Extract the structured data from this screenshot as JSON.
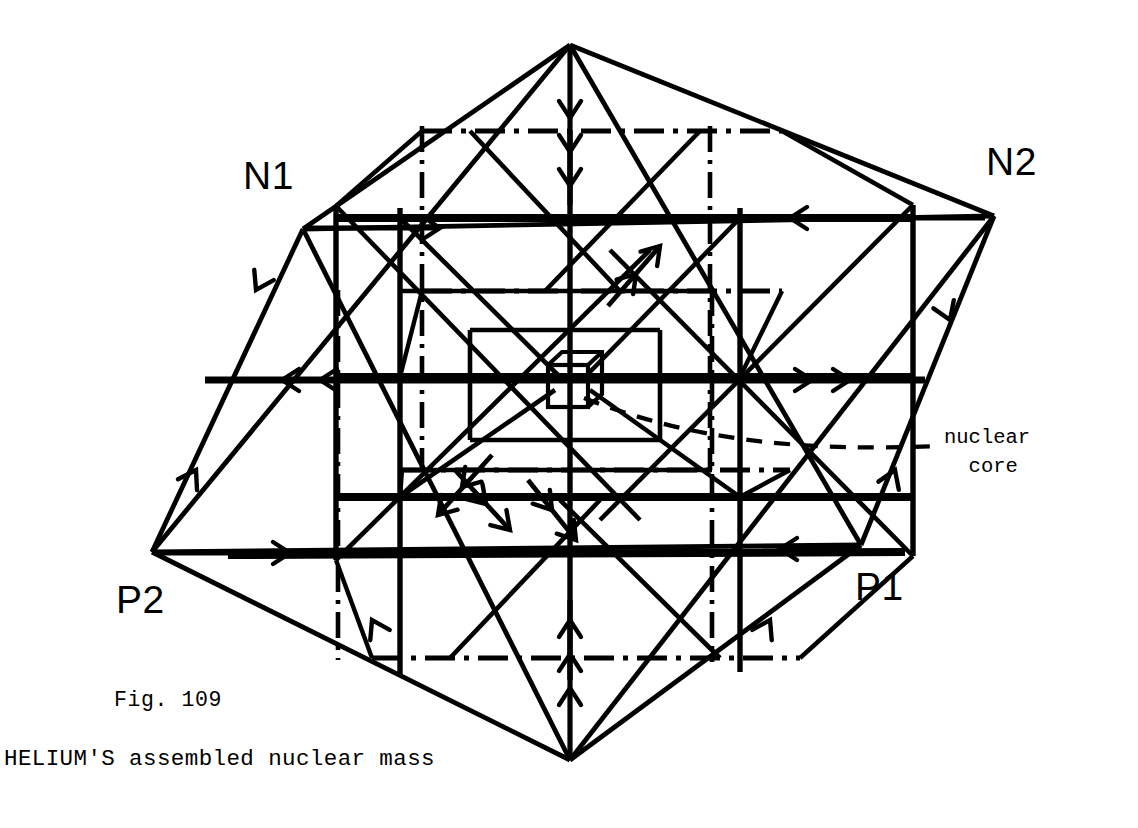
{
  "figure": {
    "number_label": "Fig. 109",
    "title": "HELIUM'S assembled nuclear mass",
    "background_color": "#ffffff",
    "ink_color": "#000000",
    "canvas": {
      "width": 1138,
      "height": 828
    }
  },
  "vertex_labels": {
    "n1": "N1",
    "n2": "N2",
    "p1": "P1",
    "p2": "P2"
  },
  "annotations": {
    "nuclear_core": "nuclear\n  core"
  },
  "diagram_data": {
    "type": "wireframe-3d-schematic",
    "subject": "helium nucleus assembled mass: octahedron of 2 protons and 2 neutrons enclosing nested cubic lattice with a nuclear core cube at center",
    "octahedron_vertices": {
      "top_apex": {
        "x": 570,
        "y": 45
      },
      "bottom_apex": {
        "x": 570,
        "y": 760
      },
      "n1": {
        "x": 303,
        "y": 229
      },
      "n2": {
        "x": 994,
        "y": 216
      },
      "p2": {
        "x": 152,
        "y": 552
      },
      "p1": {
        "x": 861,
        "y": 545
      }
    },
    "nuclear_core_cube": {
      "center": {
        "x": 567,
        "y": 385
      },
      "size": 42,
      "depth_offset": 14,
      "style": "solid outline small cube"
    },
    "line_styles": {
      "octahedron_edge": {
        "stroke_width": 4.6,
        "dash": "none"
      },
      "outer_cube_visible": {
        "stroke_width": 8.0,
        "dash": "none"
      },
      "outer_cube_hidden": {
        "stroke_width": 4.6,
        "dash": "28 9 4 9"
      },
      "inner_cube": {
        "stroke_width": 4.4,
        "dash": "none"
      },
      "inner_cube_hidden": {
        "stroke_width": 4.2,
        "dash": "24 8 3 8"
      },
      "leader_line": {
        "stroke_width": 4.0,
        "dash": "15 11"
      },
      "flow_arrow": {
        "stroke_width": 4.4,
        "dash": "none"
      }
    },
    "flow_arrows": [
      {
        "id": "n1-rail-right",
        "direction": "right",
        "heads": 1,
        "note": "horizontal rail leaving N1 toward interior"
      },
      {
        "id": "n2-rail-left",
        "direction": "left",
        "heads": 1,
        "note": "horizontal rail leaving N2 toward interior"
      },
      {
        "id": "p2-rail-right",
        "direction": "right",
        "heads": 1,
        "note": "horizontal rail leaving P2 toward interior"
      },
      {
        "id": "p1-rail-left",
        "direction": "left",
        "heads": 1,
        "note": "horizontal rail leaving P1 toward interior"
      },
      {
        "id": "mid-left-rail-left",
        "direction": "left",
        "heads": 2,
        "note": "mid-height left rail, double chevron"
      },
      {
        "id": "mid-right-rail-right",
        "direction": "right",
        "heads": 2,
        "note": "mid-height right rail, double chevron"
      },
      {
        "id": "top-apex-down",
        "direction": "down",
        "heads": 3,
        "note": "vertical axis from top apex, triple chevron"
      },
      {
        "id": "bottom-apex-up",
        "direction": "up",
        "heads": 3,
        "note": "vertical axis from bottom apex, triple chevron"
      },
      {
        "id": "diag-upper-right-in",
        "direction": "up-right",
        "heads": 2,
        "note": "interior diagonal, double chevron"
      },
      {
        "id": "diag-lower-left-in",
        "direction": "down-left",
        "heads": 2,
        "note": "interior diagonal, double chevron"
      },
      {
        "id": "edge-n1-p2-down",
        "direction": "down",
        "heads": 1,
        "note": "along octahedron edge N1 to P2"
      },
      {
        "id": "edge-n2-p1-down",
        "direction": "down",
        "heads": 1,
        "note": "along octahedron edge N2 to P1"
      },
      {
        "id": "edge-p2-n1-up",
        "direction": "up",
        "heads": 1,
        "note": "along octahedron edge P2 to N1"
      },
      {
        "id": "edge-p1-n2-up",
        "direction": "up",
        "heads": 1,
        "note": "along octahedron edge P1 to N2"
      }
    ]
  }
}
